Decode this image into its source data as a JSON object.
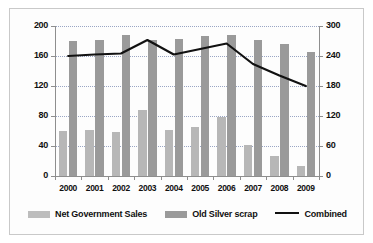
{
  "chart_data": {
    "type": "bar",
    "title": "",
    "subtitle": "",
    "xlabel": "",
    "ylabel": "",
    "ylabel_right": "",
    "grid": true,
    "legend_position": "bottom",
    "categories": [
      "2000",
      "2001",
      "2002",
      "2003",
      "2004",
      "2005",
      "2006",
      "2007",
      "2008",
      "2009"
    ],
    "axes": {
      "left": {
        "ticks": [
          "200",
          "160",
          "120",
          "80",
          "40",
          "0"
        ],
        "min": 0,
        "max": 200
      },
      "right": {
        "ticks": [
          "300",
          "240",
          "180",
          "120",
          "60",
          "0"
        ],
        "min": 0,
        "max": 300
      },
      "bottom": {
        "ticks": [
          "2000",
          "2001",
          "2002",
          "2003",
          "2004",
          "2005",
          "2006",
          "2007",
          "2008",
          "2009"
        ]
      }
    },
    "series": [
      {
        "name": "Net Government Sales",
        "key": "net_government_sales",
        "type": "bar",
        "axis": "left",
        "color": "#b7b7b7",
        "values": [
          60,
          62,
          59,
          88,
          61,
          66,
          79,
          42,
          27,
          13
        ]
      },
      {
        "name": "Old Silver scrap",
        "key": "old_silver_scrap",
        "type": "bar",
        "axis": "left",
        "color": "#9a9a9a",
        "values": [
          180,
          182,
          188,
          181,
          183,
          187,
          188,
          181,
          176,
          165
        ]
      },
      {
        "name": "Combined",
        "key": "combined",
        "type": "line",
        "axis": "right",
        "color": "#111111",
        "values": [
          240,
          243,
          245,
          272,
          243,
          254,
          265,
          224,
          201,
          180
        ]
      }
    ]
  },
  "legend": {
    "items": [
      {
        "label": "Net Government Sales",
        "marker": "swatch",
        "color": "#bdbdbd"
      },
      {
        "label": "Old Silver scrap",
        "marker": "swatch",
        "color": "#9a9a9a"
      },
      {
        "label": "Combined",
        "marker": "line",
        "color": "#111111"
      }
    ]
  }
}
